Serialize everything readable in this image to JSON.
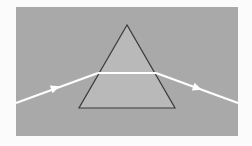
{
  "diagram": {
    "colors": {
      "page_background": "#fbfbfb",
      "panel_background": "#a9a9a9",
      "prism_fill": "#b9b9b9",
      "prism_edge": "#3a3a3a",
      "beam": "#ffffff"
    },
    "panel": {
      "x": 16,
      "y": 7,
      "width": 222,
      "height": 129
    },
    "prism": {
      "apex": [
        127,
        25
      ],
      "base_left": [
        79,
        108
      ],
      "base_right": [
        175,
        108
      ]
    },
    "beam": {
      "incident": {
        "start": [
          16,
          103
        ],
        "end": [
          98,
          73
        ],
        "arrow_at": [
          55,
          88
        ]
      },
      "internal": {
        "start": [
          98,
          73
        ],
        "end": [
          156,
          73
        ]
      },
      "emergent": {
        "start": [
          156,
          73
        ],
        "end": [
          238,
          103
        ],
        "arrow_at": [
          197,
          88
        ]
      }
    }
  }
}
